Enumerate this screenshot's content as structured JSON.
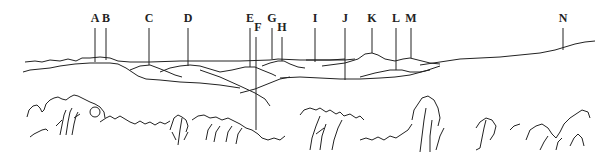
{
  "diagram": {
    "type": "panoramic landscape sketch with labeled ridgelines",
    "labels": [
      {
        "id": "A",
        "text": "A",
        "x": 95,
        "label_y": 22,
        "line_top": 28,
        "line_bottom": 62
      },
      {
        "id": "B",
        "text": "B",
        "x": 106,
        "label_y": 22,
        "line_top": 28,
        "line_bottom": 60
      },
      {
        "id": "C",
        "text": "C",
        "x": 149,
        "label_y": 22,
        "line_top": 28,
        "line_bottom": 65
      },
      {
        "id": "D",
        "text": "D",
        "x": 188,
        "label_y": 22,
        "line_top": 28,
        "line_bottom": 66
      },
      {
        "id": "E",
        "text": "E",
        "x": 250,
        "label_y": 22,
        "line_top": 28,
        "line_bottom": 67
      },
      {
        "id": "F",
        "text": "F",
        "x": 256,
        "label_y": 31,
        "line_top": 37,
        "line_bottom": 130
      },
      {
        "id": "G",
        "text": "G",
        "x": 272,
        "label_y": 22,
        "line_top": 28,
        "line_bottom": 59
      },
      {
        "id": "H",
        "text": "H",
        "x": 282,
        "label_y": 31,
        "line_top": 37,
        "line_bottom": 61
      },
      {
        "id": "I",
        "text": "I",
        "x": 315,
        "label_y": 22,
        "line_top": 28,
        "line_bottom": 62
      },
      {
        "id": "J",
        "text": "J",
        "x": 345,
        "label_y": 22,
        "line_top": 28,
        "line_bottom": 80
      },
      {
        "id": "K",
        "text": "K",
        "x": 372,
        "label_y": 22,
        "line_top": 28,
        "line_bottom": 53
      },
      {
        "id": "L",
        "text": "L",
        "x": 396,
        "label_y": 22,
        "line_top": 28,
        "line_bottom": 70
      },
      {
        "id": "M",
        "text": "M",
        "x": 411,
        "label_y": 22,
        "line_top": 28,
        "line_bottom": 58
      },
      {
        "id": "N",
        "text": "N",
        "x": 563,
        "label_y": 22,
        "line_top": 28,
        "line_bottom": 50
      }
    ]
  }
}
